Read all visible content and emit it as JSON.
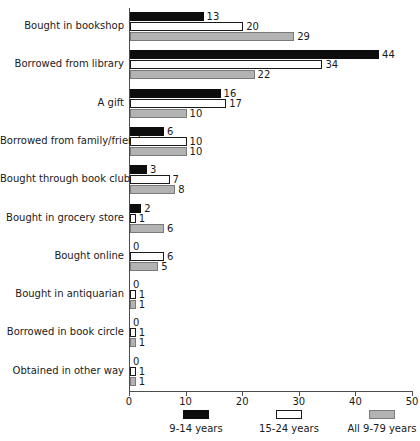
{
  "chart_data": {
    "type": "bar",
    "orientation": "horizontal",
    "title": "",
    "subtitle": "",
    "xlabel": "",
    "ylabel": "",
    "xlim": [
      0,
      50
    ],
    "xticks": [
      0,
      10,
      20,
      30,
      40,
      50
    ],
    "grid": false,
    "legend_position": "bottom",
    "categories": [
      "Bought in bookshop",
      "Borrowed from library",
      "A gift",
      "Borrowed from family/friend",
      "Bought through book club",
      "Bought in grocery store",
      "Bought online",
      "Bought in antiquarian",
      "Borrowed in book circle",
      "Obtained in other way"
    ],
    "series": [
      {
        "name": "9-14 years",
        "color": "#0d0d0d",
        "values": [
          13,
          44,
          16,
          6,
          3,
          2,
          0,
          0,
          0,
          0
        ]
      },
      {
        "name": "15-24 years",
        "color": "#ffffff",
        "values": [
          20,
          34,
          17,
          10,
          7,
          1,
          6,
          1,
          1,
          1
        ]
      },
      {
        "name": "All 9-79 years",
        "color": "#b3b3b3",
        "values": [
          29,
          22,
          10,
          10,
          8,
          6,
          5,
          1,
          1,
          1
        ]
      }
    ]
  },
  "legend": {
    "items": [
      {
        "label": "9-14 years"
      },
      {
        "label": "15-24 years"
      },
      {
        "label": "All 9-79 years"
      }
    ]
  }
}
